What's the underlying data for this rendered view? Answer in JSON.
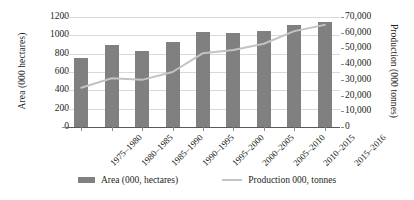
{
  "chart_data": {
    "type": "bar",
    "title": "",
    "subtitle": "",
    "xlabel": "",
    "ylabel": "Area (000 hectares)",
    "y2label": "Production (000 tonnes)",
    "grid": true,
    "legend_position": "bottom",
    "categories": [
      "1975–1980",
      "1980–1985",
      "1985–1990",
      "1990–1995",
      "1995–2000",
      "2000–2005",
      "2005–2010",
      "2010–2015",
      "2015–2016"
    ],
    "series": [
      {
        "name": "Area (000, hectares)",
        "type": "bar",
        "axis": "left",
        "color": "#808080",
        "values": [
          755,
          895,
          825,
          925,
          1040,
          1030,
          1045,
          1115,
          1150
        ]
      },
      {
        "name": "Production 000, tonnes",
        "type": "line",
        "axis": "right",
        "color": "#c3c3c3",
        "values": [
          25000,
          31000,
          30000,
          35000,
          47000,
          49000,
          53000,
          61000,
          65000
        ]
      }
    ],
    "ylim": [
      0,
      1200
    ],
    "y2lim": [
      0,
      70000
    ],
    "yticks": [
      "0",
      "200",
      "400",
      "600",
      "800",
      "1000",
      "1200"
    ],
    "ytick_values": [
      0,
      200,
      400,
      600,
      800,
      1000,
      1200
    ],
    "y2ticks": [
      "0",
      "10,000",
      "20,000",
      "30,000",
      "40,000",
      "50,000",
      "60,000",
      "70,000"
    ],
    "y2tick_values": [
      0,
      10000,
      20000,
      30000,
      40000,
      50000,
      60000,
      70000
    ]
  },
  "legend": {
    "items": [
      {
        "label": "Area (000, hectares)",
        "marker": "bar-swatch"
      },
      {
        "label": "Production 000, tonnes",
        "marker": "line-swatch"
      }
    ]
  },
  "colors": {
    "bar": "#808080",
    "line": "#c3c3c3",
    "grid": "#d9d9d9",
    "axis": "#5a5a5a",
    "text": "#231f20",
    "background": "#ffffff"
  }
}
